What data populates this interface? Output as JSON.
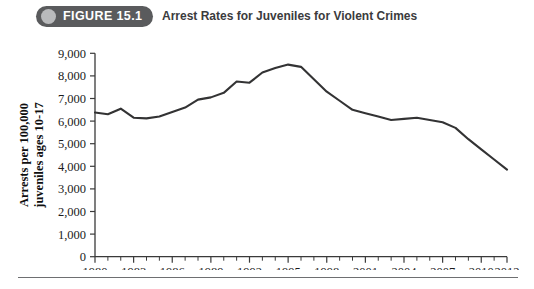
{
  "header": {
    "badge_label": "FIGURE 15.1",
    "badge_color": "#5a5b5d",
    "dot_color": "#b9babc",
    "title": "Arrest Rates for Juveniles for Violent Crimes"
  },
  "chart_data": {
    "type": "line",
    "title": "Arrest Rates for Juveniles for Violent Crimes",
    "xlabel": "",
    "ylabel": "Arrests per 100,000 juveniles ages 10-17",
    "ylabel_line1": "Arrests per 100,000",
    "ylabel_line2": "juveniles ages 10-17",
    "grid": false,
    "legend": "none",
    "line_color": "#333334",
    "xlim": [
      1980,
      2012
    ],
    "ylim": [
      0,
      9000
    ],
    "ytick_labels": [
      "9,000",
      "8,000",
      "7,000",
      "6,000",
      "5,000",
      "4,000",
      "3,000",
      "2,000",
      "1,000",
      "0"
    ],
    "ytick_values": [
      9000,
      8000,
      7000,
      6000,
      5000,
      4000,
      3000,
      2000,
      1000,
      0
    ],
    "xtick_labels": [
      "1980",
      "1983",
      "1986",
      "1989",
      "1992",
      "1995",
      "1998",
      "2001",
      "2004",
      "2007",
      "2010",
      "2012"
    ],
    "xtick_values": [
      1980,
      1983,
      1986,
      1989,
      1992,
      1995,
      1998,
      2001,
      2004,
      2007,
      2010,
      2012
    ],
    "x": [
      1980,
      1981,
      1982,
      1983,
      1984,
      1985,
      1986,
      1987,
      1988,
      1989,
      1990,
      1991,
      1992,
      1993,
      1994,
      1995,
      1996,
      1997,
      1998,
      1999,
      2000,
      2001,
      2002,
      2003,
      2004,
      2005,
      2006,
      2007,
      2008,
      2009,
      2010,
      2011,
      2012
    ],
    "values": [
      6380,
      6300,
      6550,
      6150,
      6120,
      6200,
      6400,
      6600,
      6950,
      7050,
      7250,
      7750,
      7700,
      8150,
      8350,
      8500,
      8400,
      7850,
      7300,
      6900,
      6500,
      6350,
      6200,
      6050,
      6100,
      6150,
      6050,
      5950,
      5700,
      5200,
      4750,
      4300,
      3850
    ]
  }
}
